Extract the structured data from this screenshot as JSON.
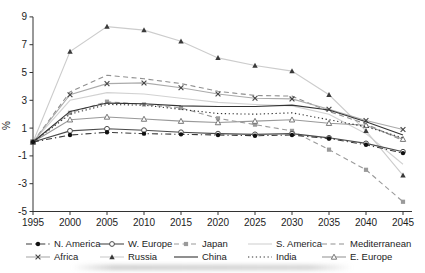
{
  "chart_data": {
    "type": "line",
    "title": "",
    "xlabel": "",
    "ylabel": "%",
    "x": [
      1995,
      2000,
      2005,
      2010,
      2015,
      2020,
      2025,
      2030,
      2035,
      2040,
      2045
    ],
    "ylim": [
      -5,
      9
    ],
    "yticks": [
      9,
      7,
      5,
      3,
      1,
      -1,
      -3,
      -5
    ],
    "grid": false,
    "legend_position": "bottom",
    "legend_rows": [
      [
        "N. America",
        "W. Europe",
        "Japan",
        "S. America",
        "Mediterranean"
      ],
      [
        "Africa",
        "Russia",
        "China",
        "India",
        "E. Europe"
      ]
    ],
    "series": [
      {
        "name": "N. America",
        "color": "#3a3a3a",
        "marker_color": "#111111",
        "dash": "dashdot",
        "marker": "filled-circle",
        "zorder": 10,
        "values": [
          0,
          0.5,
          0.7,
          0.6,
          0.55,
          0.5,
          0.45,
          0.5,
          0.25,
          -0.2,
          -0.8
        ]
      },
      {
        "name": "W. Europe",
        "color": "#4a4a4a",
        "marker_color": "#4a4a4a",
        "dash": "solid",
        "marker": "open-circle",
        "zorder": 9,
        "values": [
          0,
          0.8,
          0.95,
          0.85,
          0.7,
          0.6,
          0.55,
          0.6,
          0.3,
          -0.1,
          -0.7
        ]
      },
      {
        "name": "Japan",
        "color": "#9a9a9a",
        "marker_color": "#9a9a9a",
        "dash": "dashed",
        "marker": "filled-square",
        "zorder": 5,
        "values": [
          0,
          2.1,
          2.9,
          2.7,
          2.45,
          1.7,
          1.25,
          0.8,
          -0.55,
          -2.0,
          -4.3
        ]
      },
      {
        "name": "S. America",
        "color": "#d2d2d2",
        "marker_color": "#d2d2d2",
        "dash": "solid",
        "marker": "none",
        "zorder": 1,
        "values": [
          0,
          3.0,
          3.55,
          3.45,
          3.15,
          2.85,
          2.7,
          2.6,
          2.0,
          0.6,
          -1.6
        ]
      },
      {
        "name": "Mediterranean",
        "color": "#8f8f8f",
        "marker_color": "#8f8f8f",
        "dash": "dashed",
        "marker": "none",
        "zorder": 3,
        "values": [
          0,
          3.6,
          4.8,
          4.55,
          4.2,
          3.65,
          3.35,
          3.3,
          2.2,
          1.3,
          0.1
        ]
      },
      {
        "name": "Africa",
        "color": "#ababab",
        "marker_color": "#444444",
        "dash": "solid",
        "marker": "x",
        "zorder": 4,
        "values": [
          0,
          3.4,
          4.2,
          4.25,
          3.9,
          3.45,
          3.15,
          3.1,
          2.35,
          1.55,
          0.9
        ]
      },
      {
        "name": "Russia",
        "color": "#cccccc",
        "marker_color": "#3a3a3a",
        "dash": "solid",
        "marker": "filled-triangle",
        "zorder": 2,
        "values": [
          0,
          6.5,
          8.3,
          8.05,
          7.25,
          6.05,
          5.5,
          5.1,
          3.4,
          0.8,
          -2.4
        ]
      },
      {
        "name": "China",
        "color": "#333333",
        "marker_color": "#333333",
        "dash": "solid",
        "marker": "none",
        "zorder": 8,
        "values": [
          0,
          2.2,
          2.8,
          2.75,
          2.6,
          2.55,
          2.55,
          2.65,
          2.3,
          1.45,
          0.5
        ]
      },
      {
        "name": "India",
        "color": "#333333",
        "marker_color": "#333333",
        "dash": "dotted",
        "marker": "none",
        "zorder": 7,
        "values": [
          0,
          2.0,
          2.7,
          2.65,
          2.35,
          2.05,
          2.0,
          2.1,
          1.6,
          1.1,
          0.3
        ]
      },
      {
        "name": "E. Europe",
        "color": "#999999",
        "marker_color": "#777777",
        "dash": "solid",
        "marker": "open-triangle",
        "zorder": 6,
        "values": [
          0,
          1.6,
          1.8,
          1.65,
          1.5,
          1.4,
          1.5,
          1.6,
          1.35,
          1.2,
          0.2
        ]
      }
    ]
  }
}
